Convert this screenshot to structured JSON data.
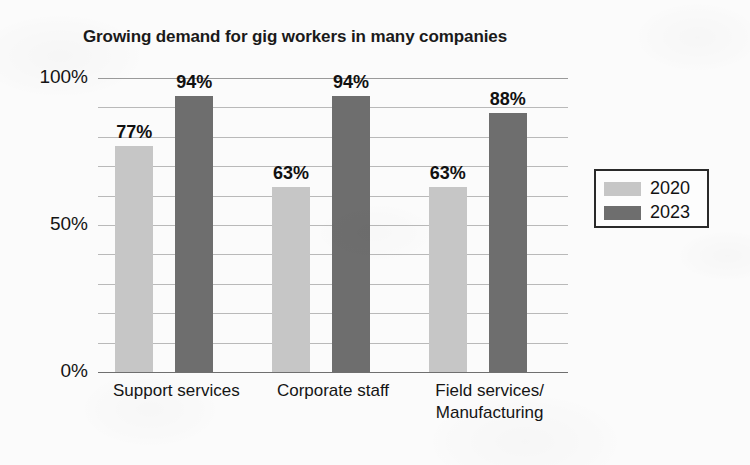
{
  "chart_data": {
    "type": "bar",
    "title": "Growing demand for gig workers in many companies",
    "xlabel": "",
    "ylabel": "",
    "ylim": [
      0,
      100
    ],
    "ytick_labels": [
      "0%",
      "50%",
      "100%"
    ],
    "ytick_values": [
      0,
      50,
      100
    ],
    "grid": "horizontal gridlines every 10%",
    "legend_position": "right",
    "categories": [
      "Support services",
      "Corporate staff",
      "Field services/\nManufacturing"
    ],
    "series": [
      {
        "name": "2020",
        "color": "#c6c6c6",
        "values": [
          77,
          63,
          63
        ],
        "labels": [
          "77%",
          "63%",
          "63%"
        ]
      },
      {
        "name": "2023",
        "color": "#6e6e6e",
        "values": [
          94,
          94,
          88
        ],
        "labels": [
          "94%",
          "94%",
          "88%"
        ]
      }
    ]
  },
  "axis": {
    "y_max_label": "100%",
    "y_mid_label": "50%",
    "y_min_label": "0%"
  },
  "legend": {
    "items": [
      {
        "label": "2020",
        "color": "#c6c6c6"
      },
      {
        "label": "2023",
        "color": "#6e6e6e"
      }
    ]
  },
  "colors": {
    "series_2020": "#c6c6c6",
    "series_2023": "#6e6e6e",
    "background": "#fbfbfb",
    "gridline": "#b9b9b9",
    "text": "#141414"
  }
}
